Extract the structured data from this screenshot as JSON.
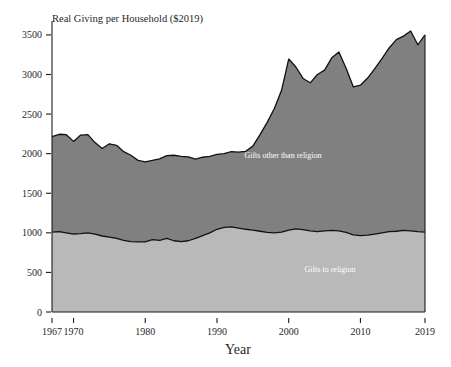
{
  "chart_data": {
    "type": "area",
    "stacked": true,
    "title": "Real Giving per Household ($2019)",
    "xlabel": "Year",
    "ylabel": "",
    "grid": false,
    "legend_position": "inline-annotations",
    "xlim": [
      1967,
      2019
    ],
    "ylim": [
      0,
      3600
    ],
    "yticks": [
      0,
      500,
      1000,
      1500,
      2000,
      2500,
      3000,
      3500
    ],
    "ytick_labels": [
      "0",
      "500",
      "1000",
      "1500",
      "2000",
      "2500",
      "3000",
      "3500"
    ],
    "xticks": [
      1967,
      1970,
      1980,
      1990,
      2000,
      2010,
      2019
    ],
    "xtick_labels": [
      "1967",
      "1970",
      "1980",
      "1990",
      "2000",
      "2010",
      "2019"
    ],
    "colors": {
      "religion": "#b9b9b9",
      "other": "#808080",
      "outline": "#111111",
      "axis": "#1a1a1a",
      "label_text": "#ffffff",
      "background": "#ffffff"
    },
    "x": [
      1967,
      1968,
      1969,
      1970,
      1971,
      1972,
      1973,
      1974,
      1975,
      1976,
      1977,
      1978,
      1979,
      1980,
      1981,
      1982,
      1983,
      1984,
      1985,
      1986,
      1987,
      1988,
      1989,
      1990,
      1991,
      1992,
      1993,
      1994,
      1995,
      1996,
      1997,
      1998,
      1999,
      2000,
      2001,
      2002,
      2003,
      2004,
      2005,
      2006,
      2007,
      2008,
      2009,
      2010,
      2011,
      2012,
      2013,
      2014,
      2015,
      2016,
      2017,
      2018,
      2019
    ],
    "series": [
      {
        "name": "Gifts to religion",
        "label": "Gifts to religion",
        "color": "#b9b9b9",
        "values": [
          1010,
          1015,
          1000,
          985,
          990,
          1000,
          985,
          960,
          945,
          930,
          905,
          890,
          885,
          885,
          915,
          905,
          930,
          900,
          890,
          900,
          930,
          965,
          1000,
          1045,
          1070,
          1075,
          1060,
          1045,
          1035,
          1020,
          1005,
          1000,
          1010,
          1035,
          1050,
          1040,
          1025,
          1015,
          1025,
          1030,
          1025,
          1005,
          975,
          965,
          970,
          985,
          1000,
          1015,
          1020,
          1030,
          1025,
          1015,
          1010
        ]
      },
      {
        "name": "Gifts other than religion",
        "label": "Gifts other than religion",
        "color": "#808080",
        "values": [
          1205,
          1230,
          1240,
          1170,
          1245,
          1240,
          1155,
          1105,
          1180,
          1175,
          1120,
          1090,
          1030,
          1010,
          1000,
          1030,
          1045,
          1080,
          1075,
          1060,
          1000,
          990,
          965,
          945,
          930,
          950,
          960,
          985,
          1060,
          1220,
          1390,
          1570,
          1790,
          2160,
          2045,
          1910,
          1870,
          1985,
          2030,
          2180,
          2260,
          2075,
          1870,
          1900,
          1985,
          2090,
          2200,
          2320,
          2420,
          2455,
          2525,
          2360,
          2490
        ]
      }
    ],
    "totals_note": "stacked total = religion + other"
  },
  "annotations": {
    "religion_label": "Gifts to religion",
    "other_label": "Gifts other than religion"
  }
}
